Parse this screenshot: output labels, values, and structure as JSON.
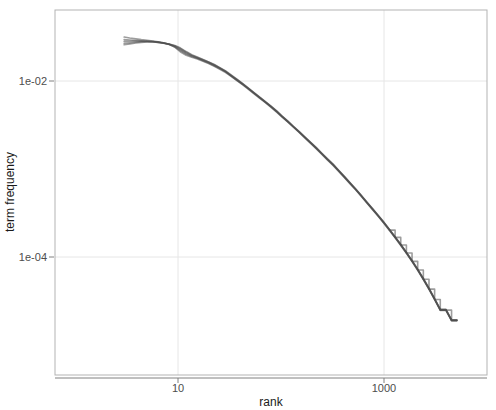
{
  "chart_data": {
    "type": "line",
    "title": "",
    "subtitle": "",
    "xlabel": "rank",
    "ylabel": "term frequency",
    "xscale": "log",
    "yscale": "log",
    "xlim": [
      2.6,
      5200
    ],
    "ylim": [
      1.05e-05,
      0.045
    ],
    "grid": true,
    "legend": null,
    "legend_position": "none",
    "xticks": [
      10,
      1000
    ],
    "xtick_labels": [
      "10",
      "1000"
    ],
    "yticks": [
      0.01,
      0.0001
    ],
    "ytick_labels": [
      "1e-02",
      "1e-04"
    ],
    "annotations": [],
    "line_color": "#4d4d4d",
    "line_opacity": 0.55,
    "line_width": 1.6,
    "panel_background": "#ffffff",
    "grid_color": "#e6e6e6",
    "panel_border_color": "#b3b3b3",
    "series": [
      {
        "name": "series-1",
        "x": [
          3,
          3.4,
          3.9,
          4.4,
          5,
          5.7,
          6.4,
          7.2,
          8.2,
          9.3,
          10.5,
          12,
          13.6,
          15.4,
          17.5,
          19.8,
          22.5,
          25.5,
          29,
          32.8,
          37.3,
          42.3,
          48,
          54.4,
          61.8,
          70.1,
          79.5,
          90.2,
          102,
          116,
          132,
          150,
          170,
          193,
          219,
          248,
          282,
          320,
          363,
          412,
          467,
          530,
          601,
          682,
          774,
          878,
          996,
          1130,
          1282,
          1454,
          1650,
          1872,
          2124,
          2410,
          2734,
          3101,
          3519,
          3992,
          4529,
          5100
        ],
        "y": [
          0.0316,
          0.0308,
          0.0301,
          0.0295,
          0.029,
          0.0285,
          0.0279,
          0.0272,
          0.0262,
          0.0243,
          0.0215,
          0.0196,
          0.0186,
          0.0178,
          0.0168,
          0.0158,
          0.0147,
          0.0136,
          0.0125,
          0.0113,
          0.0101,
          0.0091,
          0.0081,
          0.0072,
          0.0064,
          0.0057,
          0.00505,
          0.00445,
          0.0039,
          0.00342,
          0.00298,
          0.0026,
          0.00226,
          0.00196,
          0.0017,
          0.00147,
          0.00127,
          0.0011,
          0.00094,
          0.0008,
          0.00068,
          0.00058,
          0.00049,
          0.00041,
          0.000345,
          0.00029,
          0.000242,
          0.0002,
          0.000165,
          0.000135,
          0.00011,
          8.85e-05,
          7.05e-05,
          5.53e-05,
          4.28e-05,
          3.27e-05,
          2.47e-05,
          2.47e-05,
          1.88e-05,
          1.88e-05
        ]
      },
      {
        "name": "series-2",
        "x": [
          3,
          3.4,
          3.9,
          4.4,
          5,
          5.7,
          6.4,
          7.2,
          8.2,
          9.3,
          10.5,
          12,
          13.6,
          15.4,
          17.5,
          19.8,
          22.5,
          25.5,
          29,
          32.8,
          37.3,
          42.3,
          48,
          54.4,
          61.8,
          70.1,
          79.5,
          90.2,
          102,
          116,
          132,
          150,
          170,
          193,
          219,
          248,
          282,
          320,
          363,
          412,
          467,
          530,
          601,
          682,
          774,
          878,
          996,
          1130,
          1282,
          1454,
          1650,
          1872,
          2124,
          2410,
          2734,
          3101,
          3519,
          3992,
          4529,
          5100
        ],
        "y": [
          0.0295,
          0.0292,
          0.0289,
          0.0286,
          0.0283,
          0.028,
          0.0275,
          0.0269,
          0.026,
          0.0244,
          0.0222,
          0.0202,
          0.019,
          0.0181,
          0.017,
          0.016,
          0.0149,
          0.0138,
          0.0127,
          0.0114,
          0.0102,
          0.00918,
          0.00818,
          0.00728,
          0.00648,
          0.00575,
          0.0051,
          0.0045,
          0.00394,
          0.00345,
          0.003,
          0.00262,
          0.00228,
          0.00198,
          0.00172,
          0.00149,
          0.00128,
          0.00111,
          0.000948,
          0.000808,
          0.000686,
          0.000584,
          0.000494,
          0.000413,
          0.000348,
          0.000292,
          0.000244,
          0.000202,
          0.000167,
          0.000137,
          0.000111,
          8.93e-05,
          7.12e-05,
          5.58e-05,
          4.32e-05,
          3.29e-05,
          2.49e-05,
          2.49e-05,
          1.9e-05,
          1.9e-05
        ]
      },
      {
        "name": "series-3",
        "x": [
          3,
          3.4,
          3.9,
          4.4,
          5,
          5.7,
          6.4,
          7.2,
          8.2,
          9.3,
          10.5,
          12,
          13.6,
          15.4,
          17.5,
          19.8,
          22.5,
          25.5,
          29,
          32.8,
          37.3,
          42.3,
          48,
          54.4,
          61.8,
          70.1,
          79.5,
          90.2,
          102,
          116,
          132,
          150,
          170,
          193,
          219,
          248,
          282,
          320,
          363,
          412,
          467,
          530,
          601,
          682,
          774,
          878,
          996,
          1130,
          1282,
          1454,
          1650,
          1872,
          2124,
          2410,
          2734,
          3101,
          3519,
          3992,
          4529,
          5100
        ],
        "y": [
          0.0282,
          0.0283,
          0.0284,
          0.0284,
          0.0283,
          0.0281,
          0.0277,
          0.0271,
          0.0261,
          0.0248,
          0.0228,
          0.0207,
          0.0193,
          0.0183,
          0.0172,
          0.0162,
          0.0151,
          0.014,
          0.0128,
          0.0115,
          0.0103,
          0.00925,
          0.00824,
          0.00733,
          0.00652,
          0.00579,
          0.00514,
          0.00454,
          0.00397,
          0.00347,
          0.00302,
          0.00264,
          0.0023,
          0.002,
          0.00174,
          0.0015,
          0.00129,
          0.00112,
          0.000956,
          0.000814,
          0.000692,
          0.000589,
          0.000498,
          0.000416,
          0.00035,
          0.000294,
          0.000246,
          0.000204,
          0.000168,
          0.000138,
          0.000112,
          9e-05,
          7.18e-05,
          5.62e-05,
          4.36e-05,
          3.32e-05,
          2.51e-05,
          2.51e-05,
          1.91e-05,
          1.91e-05
        ]
      },
      {
        "name": "series-4",
        "x": [
          3,
          3.4,
          3.9,
          4.4,
          5,
          5.7,
          6.4,
          7.2,
          8.2,
          9.3,
          10.5,
          12,
          13.6,
          15.4,
          17.5,
          19.8,
          22.5,
          25.5,
          29,
          32.8,
          37.3,
          42.3,
          48,
          54.4,
          61.8,
          70.1,
          79.5,
          90.2,
          102,
          116,
          132,
          150,
          170,
          193,
          219,
          248,
          282,
          320,
          363,
          412,
          467,
          530,
          601,
          682,
          774,
          878,
          996,
          1130,
          1282,
          1454,
          1650,
          1872,
          2124,
          2410,
          2734,
          3101,
          3519,
          3992,
          4529,
          5100
        ],
        "y": [
          0.0268,
          0.0272,
          0.0276,
          0.0279,
          0.028,
          0.0279,
          0.0276,
          0.027,
          0.0262,
          0.0251,
          0.0234,
          0.0212,
          0.0196,
          0.0185,
          0.0174,
          0.0164,
          0.0153,
          0.0141,
          0.0129,
          0.0116,
          0.0104,
          0.00932,
          0.0083,
          0.00738,
          0.00656,
          0.00582,
          0.00517,
          0.00457,
          0.004,
          0.0035,
          0.00304,
          0.00266,
          0.00231,
          0.00201,
          0.00175,
          0.00151,
          0.0013,
          0.00113,
          0.000963,
          0.00082,
          0.000697,
          0.000593,
          0.000501,
          0.000419,
          0.000353,
          0.000296,
          0.000248,
          0.000205,
          0.000169,
          0.000139,
          0.000113,
          9.06e-05,
          7.23e-05,
          5.66e-05,
          4.4e-05,
          3.34e-05,
          2.53e-05,
          2.53e-05,
          1.92e-05,
          1.92e-05
        ]
      },
      {
        "name": "series-5",
        "x": [
          3,
          3.4,
          3.9,
          4.4,
          5,
          5.7,
          6.4,
          7.2,
          8.2,
          9.3,
          10.5,
          12,
          13.6,
          15.4,
          17.5,
          19.8,
          22.5,
          25.5,
          29,
          32.8,
          37.3,
          42.3,
          48,
          54.4,
          61.8,
          70.1,
          79.5,
          90.2,
          102,
          116,
          132,
          150,
          170,
          193,
          219,
          248,
          282,
          320,
          363,
          412,
          467,
          530,
          601,
          682,
          774,
          878,
          996,
          1130,
          1282,
          1454,
          1650,
          1872,
          2124,
          2410,
          2734,
          3101,
          3519,
          3992,
          4529,
          5100
        ],
        "y": [
          0.0258,
          0.0264,
          0.027,
          0.0274,
          0.0277,
          0.0277,
          0.0275,
          0.027,
          0.0263,
          0.0253,
          0.0238,
          0.0216,
          0.0199,
          0.0187,
          0.0176,
          0.0165,
          0.0154,
          0.0142,
          0.013,
          0.0117,
          0.0105,
          0.0094,
          0.00836,
          0.00743,
          0.0066,
          0.00586,
          0.0052,
          0.0046,
          0.00402,
          0.00352,
          0.00306,
          0.00267,
          0.00232,
          0.00202,
          0.00176,
          0.00152,
          0.00131,
          0.00114,
          0.000969,
          0.000825,
          0.000701,
          0.000596,
          0.000504,
          0.000422,
          0.000355,
          0.000298,
          0.000249,
          0.000206,
          0.00017,
          0.00014,
          0.000113,
          9.11e-05,
          7.27e-05,
          5.7e-05,
          4.43e-05,
          3.36e-05,
          2.55e-05,
          2.55e-05,
          1.93e-05,
          1.93e-05
        ]
      },
      {
        "name": "series-6-staircase",
        "x": [
          1130,
          1282,
          1282,
          1454,
          1454,
          1650,
          1650,
          1872,
          1872,
          2124,
          2124,
          2410,
          2410,
          2734,
          2734,
          3101,
          3101,
          3519,
          3519,
          3992,
          3992,
          4529,
          4529,
          5100
        ],
        "y": [
          0.000202,
          0.000202,
          0.000167,
          0.000167,
          0.000137,
          0.000137,
          0.000111,
          0.000111,
          8.93e-05,
          8.93e-05,
          7.12e-05,
          7.12e-05,
          5.58e-05,
          5.58e-05,
          4.32e-05,
          4.32e-05,
          3.29e-05,
          3.29e-05,
          2.49e-05,
          2.49e-05,
          2.49e-05,
          2.49e-05,
          1.9e-05,
          1.9e-05
        ]
      }
    ]
  }
}
